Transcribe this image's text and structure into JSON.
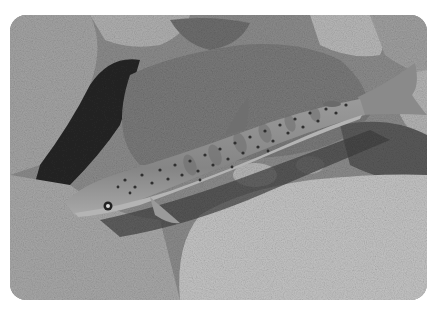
{
  "photo": {
    "subject": "spotted trout resting on granite rocks in shallow stream",
    "palette": {
      "background": "#ffffff",
      "rock_light": "#c8c8c8",
      "rock_mid": "#9a9a9a",
      "rock_dark": "#4a4a4a",
      "shadow": "#1e1e1e",
      "fish_body": "#8e8e8e",
      "fish_spots": "#3a3a3a"
    }
  }
}
